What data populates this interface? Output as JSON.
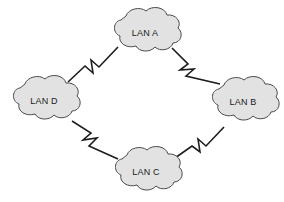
{
  "diagram": {
    "background_color": "#ffffff",
    "canvas": {
      "width": 284,
      "height": 202
    },
    "node_style": {
      "shape": "cloud",
      "fill_color": "#e2e2e2",
      "stroke_color": "#4a4a4a",
      "label_color": "#1a1a1a"
    },
    "link_style": {
      "stroke_color": "#1c1c1c",
      "decoration": "lightning-bolt-zigzag"
    },
    "nodes": [
      {
        "id": "lan-a",
        "label": "LAN A",
        "position": "top",
        "cx": 145,
        "cy": 33,
        "rx": 36,
        "ry": 24
      },
      {
        "id": "lan-b",
        "label": "LAN B",
        "position": "right",
        "cx": 243,
        "cy": 102,
        "rx": 36,
        "ry": 24
      },
      {
        "id": "lan-c",
        "label": "LAN C",
        "position": "bottom",
        "cx": 146,
        "cy": 172,
        "rx": 36,
        "ry": 24
      },
      {
        "id": "lan-d",
        "label": "LAN D",
        "position": "left",
        "cx": 44,
        "cy": 101,
        "rx": 36,
        "ry": 24
      }
    ],
    "links": [
      {
        "id": "link-da",
        "from": "LAN D",
        "to": "LAN A",
        "side": "upper-left"
      },
      {
        "id": "link-ab",
        "from": "LAN A",
        "to": "LAN B",
        "side": "upper-right"
      },
      {
        "id": "link-dc",
        "from": "LAN D",
        "to": "LAN C",
        "side": "lower-left"
      },
      {
        "id": "link-cb",
        "from": "LAN C",
        "to": "LAN B",
        "side": "lower-right"
      }
    ]
  }
}
